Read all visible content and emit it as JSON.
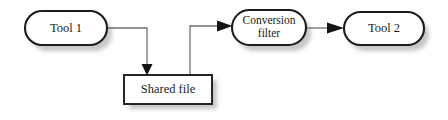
{
  "diagram": {
    "background_color": "#ffffff",
    "outline_color": "#1c1c1c",
    "shadow_color": "#c6c6c6",
    "connector_color": "#6f6f6f",
    "arrow_color": "#141414",
    "nodes": [
      {
        "id": "tool-1",
        "label": "Tool 1",
        "shape": "stadium",
        "x": 25,
        "y": 11,
        "width": 82,
        "height": 34
      },
      {
        "id": "shared-file",
        "label": "Shared file",
        "shape": "rectangle",
        "x": 124,
        "y": 75,
        "width": 88,
        "height": 29
      },
      {
        "id": "conversion-filter",
        "label": "Conversion filter",
        "label_line_1": "Conversion",
        "label_line_2": "filter",
        "shape": "stadium",
        "x": 232,
        "y": 10,
        "width": 74,
        "height": 35
      },
      {
        "id": "tool-2",
        "label": "Tool 2",
        "shape": "stadium",
        "x": 344,
        "y": 12,
        "width": 80,
        "height": 33
      }
    ],
    "edges": [
      {
        "id": "tool1-to-shared-file",
        "from": "tool-1",
        "to": "shared-file",
        "style": "orthogonal",
        "arrow": "filled-triangle"
      },
      {
        "id": "shared-file-to-conversion-filter",
        "from": "shared-file",
        "to": "conversion-filter",
        "style": "orthogonal",
        "arrow": "filled-triangle"
      },
      {
        "id": "conversion-filter-to-tool2",
        "from": "conversion-filter",
        "to": "tool-2",
        "style": "straight",
        "arrow": "filled-triangle"
      }
    ]
  }
}
